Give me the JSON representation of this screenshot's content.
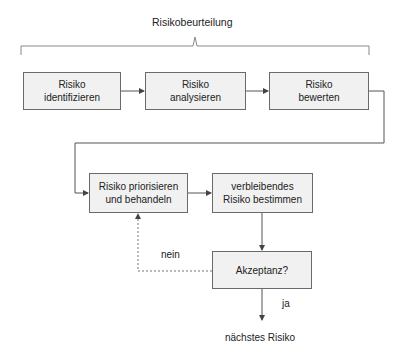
{
  "title": "Risikobeurteilung",
  "boxes": {
    "identify": {
      "line1": "Risiko",
      "line2": "identifizieren"
    },
    "analyze": {
      "line1": "Risiko",
      "line2": "analysieren"
    },
    "evaluate": {
      "line1": "Risiko",
      "line2": "bewerten"
    },
    "prioritize": {
      "line1": "Risiko priorisieren",
      "line2": "und behandeln"
    },
    "residual": {
      "line1": "verbleibendes",
      "line2": "Risiko bestimmen"
    },
    "acceptance": {
      "line1": "Akzeptanz?"
    }
  },
  "edges": {
    "no_label": "nein",
    "yes_label": "ja"
  },
  "terminal": "nächstes Risiko",
  "colors": {
    "box_fill": "#f1f1f1",
    "box_border": "#6a6a6a",
    "line": "#6a6a6a"
  }
}
